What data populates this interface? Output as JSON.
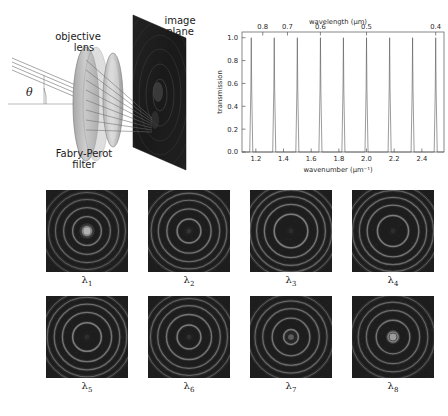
{
  "schematic": {
    "objective_lens_label": "objective\nlens",
    "objective_lens_line1": "objective",
    "objective_lens_line2": "lens",
    "image_plane_line1": "image",
    "image_plane_line2": "plane",
    "filter_line1": "Fabry-Perot",
    "filter_line2": "filter",
    "angle_symbol": "θ"
  },
  "chart_data": {
    "type": "line",
    "title": "",
    "xlabel": "wavenumber (µm⁻¹)",
    "ylabel": "transmission",
    "top_xlabel": "wavelength (µm)",
    "xlim": [
      1.1,
      2.56
    ],
    "ylim": [
      0.0,
      1.05
    ],
    "xticks": [
      1.2,
      1.4,
      1.6,
      1.8,
      2.0,
      2.2,
      2.4
    ],
    "xticklabels": [
      "1.2",
      "1.4",
      "1.6",
      "1.8",
      "2.0",
      "2.2",
      "2.4"
    ],
    "yticks": [
      0.0,
      0.2,
      0.4,
      0.6,
      0.8,
      1.0
    ],
    "yticklabels": [
      "0.0",
      "0.2",
      "0.4",
      "0.6",
      "0.8",
      "1.0"
    ],
    "top_ticks_wavelength": [
      0.8,
      0.7,
      0.6,
      0.5,
      0.4
    ],
    "top_ticklabels": [
      "0.8",
      "0.7",
      "0.6",
      "0.5",
      "0.4"
    ],
    "grid": false,
    "legend": "none",
    "peak_wavenumbers": [
      1.167,
      1.333,
      1.5,
      1.667,
      1.833,
      2.0,
      2.167,
      2.333,
      2.5
    ],
    "peak_wavelengths_um": [
      0.857,
      0.75,
      0.667,
      0.6,
      0.545,
      0.5,
      0.462,
      0.429,
      0.4
    ],
    "peak_heights": [
      1.0,
      1.0,
      1.0,
      1.0,
      1.0,
      1.0,
      1.0,
      1.0,
      1.0
    ],
    "peak_halfwidth": 0.011,
    "free_spectral_range": 0.1667,
    "baseline": 0.0
  },
  "fringe_panels": {
    "rows": [
      [
        {
          "caption_base": "λ",
          "caption_sub": "1",
          "name": "lambda-1",
          "rings": [
            0.055,
            0.175,
            0.285,
            0.385,
            0.47,
            0.55
          ],
          "center_bright": 0.9,
          "center_radius": 0.045
        },
        {
          "caption_base": "λ",
          "caption_sub": "2",
          "name": "lambda-2",
          "rings": [
            0.145,
            0.27,
            0.375,
            0.462,
            0.54
          ],
          "center_bright": 0.12,
          "center_radius": 0.03
        },
        {
          "caption_base": "λ",
          "caption_sub": "3",
          "name": "lambda-3",
          "rings": [
            0.205,
            0.325,
            0.42,
            0.5,
            0.575
          ],
          "center_bright": 0.08,
          "center_radius": 0.03
        },
        {
          "caption_base": "λ",
          "caption_sub": "4",
          "name": "lambda-4",
          "rings": [
            0.19,
            0.315,
            0.41,
            0.495,
            0.57
          ],
          "center_bright": 0.08,
          "center_radius": 0.03
        }
      ],
      [
        {
          "caption_base": "λ",
          "caption_sub": "5",
          "name": "lambda-5",
          "rings": [
            0.175,
            0.3,
            0.4,
            0.485,
            0.56
          ],
          "center_bright": 0.08,
          "center_radius": 0.03
        },
        {
          "caption_base": "λ",
          "caption_sub": "6",
          "name": "lambda-6",
          "rings": [
            0.145,
            0.275,
            0.382,
            0.47,
            0.548
          ],
          "center_bright": 0.1,
          "center_radius": 0.03
        },
        {
          "caption_base": "λ",
          "caption_sub": "7",
          "name": "lambda-7",
          "rings": [
            0.09,
            0.23,
            0.345,
            0.44,
            0.525
          ],
          "center_bright": 0.35,
          "center_radius": 0.035
        },
        {
          "caption_base": "λ",
          "caption_sub": "8",
          "name": "lambda-8",
          "rings": [
            0.062,
            0.205,
            0.325,
            0.425,
            0.512
          ],
          "center_bright": 0.75,
          "center_radius": 0.042
        }
      ]
    ]
  },
  "colors": {
    "background": "#ffffff",
    "panel_dark": "#1d1d1d",
    "fringe_ring": "#9a9a9a",
    "axis": "#555555",
    "trace": "#4a4a4a",
    "text": "#1a1a1a"
  }
}
